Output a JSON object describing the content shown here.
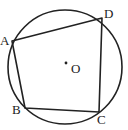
{
  "diagram": {
    "type": "geometry",
    "circle": {
      "cx": 65,
      "cy": 67,
      "r": 57,
      "stroke": "#222222"
    },
    "center": {
      "label": "O",
      "x": 66,
      "y": 63
    },
    "points": [
      {
        "label": "A",
        "x": 12,
        "y": 41
      },
      {
        "label": "B",
        "x": 25,
        "y": 108
      },
      {
        "label": "C",
        "x": 99,
        "y": 112
      },
      {
        "label": "D",
        "x": 102,
        "y": 18
      }
    ],
    "labels": {
      "A": "A",
      "B": "B",
      "C": "C",
      "D": "D",
      "O": "O"
    },
    "edges": [
      "AB",
      "BC",
      "CD",
      "DA"
    ]
  }
}
